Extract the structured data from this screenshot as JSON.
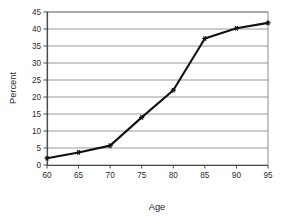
{
  "chart_data": {
    "type": "line",
    "title": "",
    "xlabel": "Age",
    "ylabel": "Percent",
    "x": [
      60,
      65,
      70,
      75,
      80,
      85,
      90,
      95
    ],
    "values": [
      2,
      3.7,
      5.7,
      14,
      22,
      37.2,
      40.2,
      41.8
    ],
    "series": [
      {
        "name": "Percent by Age",
        "values": [
          2,
          3.7,
          5.7,
          14,
          22,
          37.2,
          40.2,
          41.8
        ]
      }
    ],
    "xlim": [
      60,
      95
    ],
    "ylim": [
      0,
      45
    ],
    "xticks": [
      60,
      65,
      70,
      75,
      80,
      85,
      90,
      95
    ],
    "yticks": [
      0,
      5,
      10,
      15,
      20,
      25,
      30,
      35,
      40,
      45
    ],
    "xtick_labels": [
      "60",
      "65",
      "70",
      "75",
      "80",
      "85",
      "90",
      "95"
    ],
    "ytick_labels": [
      "0",
      "5",
      "10",
      "15",
      "20",
      "25",
      "30",
      "35",
      "40",
      "45"
    ],
    "grid": {
      "horizontal": true,
      "vertical": false,
      "color": "#8c8c8c"
    },
    "legend": {
      "visible": false,
      "position": "none"
    },
    "marker": "star",
    "line_color": "#111111",
    "marker_color": "#111111",
    "plot_border_color": "#8c8c8c",
    "background_color": "#ffffff"
  }
}
